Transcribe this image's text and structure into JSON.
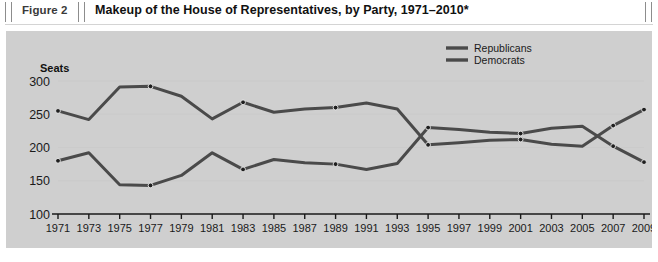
{
  "header": {
    "figure_number": "Figure 2",
    "title": "Makeup of the House of Representatives, by Party, 1971–2010*"
  },
  "colors": {
    "panel_background": "#cfcfcf",
    "page_background": "#ffffff",
    "series_line": "#4a4a4a",
    "axis": "#1a1a1a",
    "rule": "#8d8d8d",
    "gridline": "#c4c4c4"
  },
  "legend": {
    "position": "top-right",
    "entries": [
      {
        "label": "Republicans",
        "color": "#4a4a4a"
      },
      {
        "label": "Democrats",
        "color": "#4a4a4a"
      }
    ]
  },
  "chart_data": {
    "type": "line",
    "title": "Makeup of the House of Representatives, by Party, 1971–2010*",
    "xlabel": "",
    "ylabel": "Seats",
    "grid": false,
    "legend_position": "top-right",
    "x": [
      1971,
      1973,
      1975,
      1977,
      1979,
      1981,
      1983,
      1985,
      1987,
      1989,
      1991,
      1993,
      1995,
      1997,
      1999,
      2001,
      2003,
      2005,
      2007,
      2009
    ],
    "categories": [
      "1971",
      "1973",
      "1975",
      "1977",
      "1979",
      "1981",
      "1983",
      "1985",
      "1987",
      "1989",
      "1991",
      "1993",
      "1995",
      "1997",
      "1999",
      "2001",
      "2003",
      "2005",
      "2007",
      "2009"
    ],
    "xlim": [
      1971,
      2009
    ],
    "ylim": [
      100,
      300
    ],
    "yticks": [
      100,
      150,
      200,
      250,
      300
    ],
    "ytick_labels": [
      "100",
      "150",
      "200",
      "250",
      "300"
    ],
    "series": [
      {
        "name": "Democrats",
        "color": "#4a4a4a",
        "values": [
          255,
          242,
          291,
          292,
          277,
          243,
          268,
          253,
          258,
          260,
          267,
          258,
          204,
          207,
          211,
          212,
          205,
          202,
          233,
          257
        ]
      },
      {
        "name": "Republicans",
        "color": "#4a4a4a",
        "values": [
          180,
          192,
          144,
          143,
          158,
          192,
          167,
          182,
          177,
          175,
          167,
          176,
          230,
          227,
          223,
          221,
          229,
          232,
          202,
          178
        ]
      }
    ]
  }
}
